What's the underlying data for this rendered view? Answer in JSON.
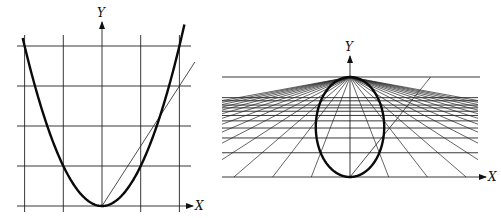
{
  "chart_data": [
    {
      "type": "line",
      "name": "cartesian-parabola",
      "title": "",
      "xlabel": "X",
      "ylabel": "Y",
      "grid": true,
      "grid_x_units": [
        -2,
        -1,
        0,
        1,
        2
      ],
      "grid_y_units": [
        0,
        1,
        2,
        3,
        4
      ],
      "series": [
        {
          "name": "parabola",
          "equation": "y = x^2",
          "x": [
            -2.1,
            -2,
            -1.5,
            -1,
            -0.5,
            0,
            0.5,
            1,
            1.5,
            2,
            2.1
          ],
          "y": [
            4.41,
            4,
            2.25,
            1,
            0.25,
            0,
            0.25,
            1,
            2.25,
            4,
            4.41
          ]
        },
        {
          "name": "line",
          "equation": "y = 1.5x",
          "x": [
            0,
            1.5,
            2.4
          ],
          "y": [
            0,
            2.25,
            3.6
          ]
        }
      ]
    },
    {
      "type": "line",
      "name": "projective-image",
      "title": "",
      "xlabel": "X",
      "ylabel": "Y",
      "grid": true,
      "projection": "perspective grid converging to point on horizon",
      "series": [
        {
          "name": "ellipse (image of parabola)"
        },
        {
          "name": "line (image of y = 1.5x)"
        }
      ]
    }
  ],
  "labels": {
    "left_x": "X",
    "left_y": "Y",
    "right_x": "X",
    "right_y": "Y"
  }
}
